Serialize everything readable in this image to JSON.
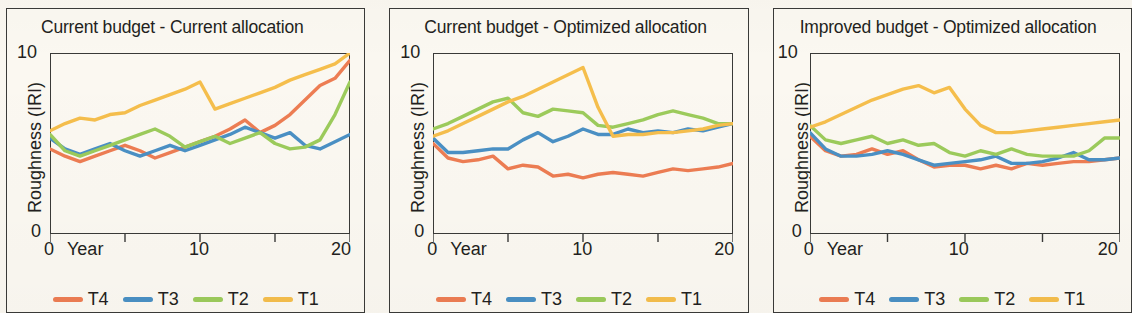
{
  "figure": {
    "background_color": "#faf7f0",
    "axis_color": "#3a3a38",
    "text_color": "#231f20"
  },
  "series_colors": {
    "T4": "#ED7D53",
    "T3": "#4A90C4",
    "T2": "#9CCB5B",
    "T1": "#F5BE4C"
  },
  "legend": {
    "items": [
      {
        "label": "T4",
        "color": "#ED7D53"
      },
      {
        "label": "T3",
        "color": "#4A90C4"
      },
      {
        "label": "T2",
        "color": "#9CCB5B"
      },
      {
        "label": "T1",
        "color": "#F5BE4C"
      }
    ]
  },
  "axes": {
    "ylabel": "Roughness (IRI)",
    "ytick_top": "10",
    "ytick_bottom": "0",
    "xtick_0": "0",
    "xaxis_name": "Year",
    "xtick_10": "10",
    "xtick_20": "20"
  },
  "panels": [
    {
      "title": "Current budget - Current allocation"
    },
    {
      "title": "Current budget - Optimized allocation"
    },
    {
      "title": "Improved budget - Optimized allocation"
    }
  ],
  "chart_data": [
    {
      "type": "line",
      "title": "Current budget - Current allocation",
      "xlabel": "Year",
      "ylabel": "Roughness (IRI)",
      "xlim": [
        0,
        20
      ],
      "ylim": [
        0,
        10
      ],
      "xticks": [
        0,
        5,
        10,
        15,
        20
      ],
      "yticks": [
        0,
        10
      ],
      "grid": false,
      "legend_position": "bottom",
      "x": [
        0,
        1,
        2,
        3,
        4,
        5,
        6,
        7,
        8,
        9,
        10,
        11,
        12,
        13,
        14,
        15,
        16,
        17,
        18,
        19,
        20
      ],
      "series": [
        {
          "name": "T4",
          "color": "#ED7D53",
          "values": [
            4.7,
            4.3,
            4.0,
            4.3,
            4.6,
            4.9,
            4.6,
            4.2,
            4.5,
            4.8,
            5.1,
            5.4,
            5.8,
            6.3,
            5.6,
            6.0,
            6.6,
            7.4,
            8.2,
            8.6,
            9.6
          ]
        },
        {
          "name": "T3",
          "color": "#4A90C4",
          "values": [
            5.3,
            4.7,
            4.4,
            4.7,
            5.0,
            4.6,
            4.3,
            4.6,
            4.9,
            4.6,
            4.9,
            5.2,
            5.5,
            5.9,
            5.6,
            5.3,
            5.6,
            4.9,
            4.7,
            5.1,
            5.5
          ]
        },
        {
          "name": "T2",
          "color": "#9CCB5B",
          "values": [
            5.5,
            4.6,
            4.3,
            4.6,
            4.9,
            5.2,
            5.5,
            5.8,
            5.4,
            4.8,
            5.1,
            5.4,
            5.0,
            5.3,
            5.6,
            5.0,
            4.7,
            4.8,
            5.2,
            6.6,
            8.4
          ]
        },
        {
          "name": "T1",
          "color": "#F5BE4C",
          "values": [
            5.7,
            6.1,
            6.4,
            6.3,
            6.6,
            6.7,
            7.1,
            7.4,
            7.7,
            8.0,
            8.4,
            6.9,
            7.2,
            7.5,
            7.8,
            8.1,
            8.5,
            8.8,
            9.1,
            9.4,
            10.0
          ]
        }
      ]
    },
    {
      "type": "line",
      "title": "Current budget - Optimized allocation",
      "xlabel": "Year",
      "ylabel": "Roughness (IRI)",
      "xlim": [
        0,
        20
      ],
      "ylim": [
        0,
        10
      ],
      "xticks": [
        0,
        5,
        10,
        15,
        20
      ],
      "yticks": [
        0,
        10
      ],
      "grid": false,
      "legend_position": "bottom",
      "x": [
        0,
        1,
        2,
        3,
        4,
        5,
        6,
        7,
        8,
        9,
        10,
        11,
        12,
        13,
        14,
        15,
        16,
        17,
        18,
        19,
        20
      ],
      "series": [
        {
          "name": "T4",
          "color": "#ED7D53",
          "values": [
            5.0,
            4.2,
            4.0,
            4.1,
            4.3,
            3.6,
            3.8,
            3.7,
            3.2,
            3.3,
            3.1,
            3.3,
            3.4,
            3.3,
            3.2,
            3.4,
            3.6,
            3.5,
            3.6,
            3.7,
            3.9
          ]
        },
        {
          "name": "T3",
          "color": "#4A90C4",
          "values": [
            5.3,
            4.5,
            4.5,
            4.6,
            4.7,
            4.7,
            5.2,
            5.6,
            5.1,
            5.4,
            5.8,
            5.5,
            5.5,
            5.8,
            5.6,
            5.7,
            5.6,
            5.8,
            5.7,
            5.9,
            6.1
          ]
        },
        {
          "name": "T2",
          "color": "#9CCB5B",
          "values": [
            5.8,
            6.1,
            6.5,
            6.9,
            7.3,
            7.5,
            6.7,
            6.5,
            6.9,
            6.8,
            6.7,
            6.0,
            5.9,
            6.1,
            6.3,
            6.6,
            6.8,
            6.6,
            6.4,
            6.1,
            6.1
          ]
        },
        {
          "name": "T1",
          "color": "#F5BE4C",
          "values": [
            5.4,
            5.7,
            6.1,
            6.5,
            6.9,
            7.3,
            7.6,
            8.0,
            8.4,
            8.8,
            9.2,
            7.0,
            5.4,
            5.5,
            5.5,
            5.6,
            5.6,
            5.7,
            5.8,
            6.0,
            6.1
          ]
        }
      ]
    },
    {
      "type": "line",
      "title": "Improved budget - Optimized allocation",
      "xlabel": "Year",
      "ylabel": "Roughness (IRI)",
      "xlim": [
        0,
        20
      ],
      "ylim": [
        0,
        10
      ],
      "xticks": [
        0,
        5,
        10,
        15,
        20
      ],
      "yticks": [
        0,
        10
      ],
      "grid": false,
      "legend_position": "bottom",
      "x": [
        0,
        1,
        2,
        3,
        4,
        5,
        6,
        7,
        8,
        9,
        10,
        11,
        12,
        13,
        14,
        15,
        16,
        17,
        18,
        19,
        20
      ],
      "series": [
        {
          "name": "T4",
          "color": "#ED7D53",
          "values": [
            5.4,
            4.6,
            4.3,
            4.4,
            4.7,
            4.4,
            4.6,
            4.1,
            3.7,
            3.8,
            3.8,
            3.6,
            3.8,
            3.6,
            3.9,
            3.8,
            3.9,
            4.0,
            4.0,
            4.1,
            4.2
          ]
        },
        {
          "name": "T3",
          "color": "#4A90C4",
          "values": [
            5.6,
            4.7,
            4.3,
            4.3,
            4.4,
            4.6,
            4.4,
            4.1,
            3.8,
            3.9,
            4.0,
            4.1,
            4.3,
            3.9,
            3.9,
            4.0,
            4.2,
            4.5,
            4.1,
            4.1,
            4.2
          ]
        },
        {
          "name": "T2",
          "color": "#9CCB5B",
          "values": [
            6.0,
            5.2,
            5.0,
            5.2,
            5.4,
            5.0,
            5.2,
            4.9,
            5.0,
            4.5,
            4.3,
            4.6,
            4.4,
            4.7,
            4.4,
            4.3,
            4.3,
            4.3,
            4.6,
            5.3,
            5.3
          ]
        },
        {
          "name": "T1",
          "color": "#F5BE4C",
          "values": [
            5.9,
            6.2,
            6.6,
            7.0,
            7.4,
            7.7,
            8.0,
            8.2,
            7.8,
            8.1,
            6.9,
            6.0,
            5.6,
            5.6,
            5.7,
            5.8,
            5.9,
            6.0,
            6.1,
            6.2,
            6.3
          ]
        }
      ]
    }
  ]
}
